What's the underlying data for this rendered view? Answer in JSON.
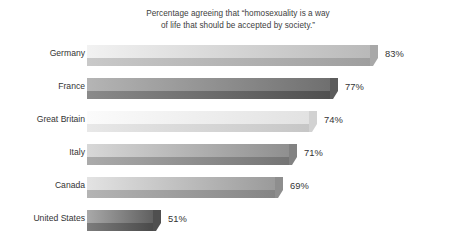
{
  "chart_data": {
    "type": "bar",
    "orientation": "horizontal",
    "title_lines": [
      "Percentage agreeing that “homosexuality is a way",
      "of life that should be accepted by society.”"
    ],
    "xlabel": "",
    "ylabel": "",
    "grid": false,
    "legend": false,
    "axis_visible": false,
    "value_suffix": "%",
    "categories": [
      "Germany",
      "France",
      "Great Britain",
      "Italy",
      "Canada",
      "United States"
    ],
    "values": [
      83,
      77,
      74,
      71,
      69,
      51
    ],
    "value_labels": [
      "83%",
      "77%",
      "74%",
      "71%",
      "69%",
      "51%"
    ],
    "xlim": [
      40,
      88
    ],
    "bars": [
      {
        "category": "Germany",
        "value": 83,
        "value_label": "83%",
        "top_face_start": "#f2f2f2",
        "top_face_end": "#b9b9b9",
        "bottom_face_start": "#c9c9c9",
        "bottom_face_end": "#9e9e9e",
        "cap_color": "#a8a8a8"
      },
      {
        "category": "France",
        "value": 77,
        "value_label": "77%",
        "top_face_start": "#b5b5b5",
        "top_face_end": "#6f6f6f",
        "bottom_face_start": "#8a8a8a",
        "bottom_face_end": "#4f4f4f",
        "cap_color": "#5c5c5c"
      },
      {
        "category": "Great Britain",
        "value": 74,
        "value_label": "74%",
        "top_face_start": "#fbfbfb",
        "top_face_end": "#e2e2e2",
        "bottom_face_start": "#e8e8e8",
        "bottom_face_end": "#c6c6c6",
        "cap_color": "#d2d2d2"
      },
      {
        "category": "Italy",
        "value": 71,
        "value_label": "71%",
        "top_face_start": "#d8d8d8",
        "top_face_end": "#8f8f8f",
        "bottom_face_start": "#ababab",
        "bottom_face_end": "#747474",
        "cap_color": "#828282"
      },
      {
        "category": "Canada",
        "value": 69,
        "value_label": "69%",
        "top_face_start": "#e3e3e3",
        "top_face_end": "#9a9a9a",
        "bottom_face_start": "#b4b4b4",
        "bottom_face_end": "#848484",
        "cap_color": "#8e8e8e"
      },
      {
        "category": "United States",
        "value": 51,
        "value_label": "51%",
        "top_face_start": "#a9a9a9",
        "top_face_end": "#5f5f5f",
        "bottom_face_start": "#7d7d7d",
        "bottom_face_end": "#494949",
        "cap_color": "#4f4f4f"
      }
    ],
    "colors": {
      "background": "#ffffff",
      "text": "#333333",
      "title_text": "#3d3d3d"
    }
  }
}
